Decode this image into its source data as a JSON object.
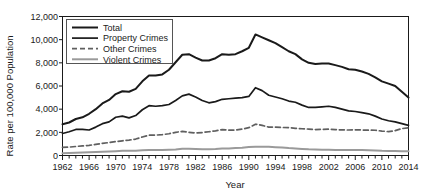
{
  "chart_data": {
    "type": "line",
    "title": "",
    "xlabel": "Year",
    "ylabel": "Rate per 100,000 Population",
    "xlim": [
      1962,
      2014
    ],
    "ylim": [
      0,
      12000
    ],
    "ytick_labels": [
      "0",
      "2,000",
      "4,000",
      "6,000",
      "8,000",
      "10,000",
      "12,000"
    ],
    "ytick_values": [
      0,
      2000,
      4000,
      6000,
      8000,
      10000,
      12000
    ],
    "xtick_labels": [
      "1962",
      "1966",
      "1970",
      "1974",
      "1978",
      "1982",
      "1986",
      "1990",
      "1994",
      "1998",
      "2002",
      "2006",
      "2010",
      "2014"
    ],
    "xtick_values": [
      1962,
      1966,
      1970,
      1974,
      1978,
      1982,
      1986,
      1990,
      1994,
      1998,
      2002,
      2006,
      2010,
      2014
    ],
    "minor_xtick_interval": 1,
    "grid": false,
    "legend_position": "top-left",
    "x": [
      1962,
      1963,
      1964,
      1965,
      1966,
      1967,
      1968,
      1969,
      1970,
      1971,
      1972,
      1973,
      1974,
      1975,
      1976,
      1977,
      1978,
      1979,
      1980,
      1981,
      1982,
      1983,
      1984,
      1985,
      1986,
      1987,
      1988,
      1989,
      1990,
      1991,
      1992,
      1993,
      1994,
      1995,
      1996,
      1997,
      1998,
      1999,
      2000,
      2001,
      2002,
      2003,
      2004,
      2005,
      2006,
      2007,
      2008,
      2009,
      2010,
      2011,
      2012,
      2013,
      2014
    ],
    "series": [
      {
        "name": "Total",
        "color": "#1a1a1a",
        "width": 2.0,
        "dash": "none",
        "values": [
          2700,
          2850,
          3150,
          3300,
          3600,
          4000,
          4500,
          4800,
          5300,
          5550,
          5500,
          5750,
          6400,
          6900,
          6900,
          7000,
          7400,
          8050,
          8700,
          8750,
          8450,
          8200,
          8200,
          8400,
          8750,
          8700,
          8750,
          9000,
          9300,
          10450,
          10200,
          9950,
          9700,
          9350,
          9000,
          8750,
          8300,
          8000,
          7900,
          7950,
          7950,
          7800,
          7650,
          7450,
          7400,
          7250,
          7050,
          6750,
          6400,
          6200,
          6000,
          5500,
          5000
        ]
      },
      {
        "name": "Property Crimes",
        "color": "#1a1a1a",
        "width": 1.7,
        "dash": "none",
        "values": [
          1900,
          2050,
          2250,
          2250,
          2200,
          2450,
          2750,
          2900,
          3300,
          3400,
          3250,
          3450,
          3950,
          4300,
          4250,
          4300,
          4400,
          4750,
          5150,
          5300,
          5050,
          4750,
          4550,
          4650,
          4850,
          4900,
          4950,
          5000,
          5100,
          5850,
          5600,
          5200,
          5050,
          4900,
          4700,
          4600,
          4350,
          4150,
          4150,
          4200,
          4250,
          4150,
          4000,
          3850,
          3800,
          3700,
          3600,
          3400,
          3150,
          3000,
          2900,
          2750,
          2600
        ]
      },
      {
        "name": "Other Crimes",
        "color": "#5f5f5f",
        "width": 1.7,
        "dash": "5,3",
        "values": [
          700,
          720,
          780,
          830,
          880,
          960,
          1050,
          1120,
          1200,
          1270,
          1330,
          1420,
          1600,
          1750,
          1760,
          1800,
          1880,
          2000,
          2080,
          2000,
          1950,
          1980,
          2050,
          2130,
          2230,
          2190,
          2200,
          2280,
          2400,
          2700,
          2600,
          2450,
          2450,
          2420,
          2400,
          2350,
          2310,
          2280,
          2240,
          2260,
          2270,
          2230,
          2210,
          2200,
          2220,
          2200,
          2190,
          2180,
          2110,
          2060,
          2150,
          2320,
          2400
        ]
      },
      {
        "name": "Violent Crimes",
        "color": "#9a9a9a",
        "width": 2.0,
        "dash": "none",
        "values": [
          200,
          210,
          230,
          250,
          270,
          300,
          330,
          350,
          370,
          400,
          410,
          420,
          450,
          480,
          470,
          470,
          490,
          520,
          580,
          590,
          570,
          540,
          540,
          560,
          610,
          610,
          640,
          660,
          730,
          760,
          760,
          750,
          720,
          690,
          640,
          610,
          570,
          530,
          510,
          500,
          500,
          480,
          470,
          470,
          480,
          470,
          460,
          430,
          400,
          390,
          390,
          370,
          370
        ]
      }
    ]
  },
  "legend": {
    "entries": [
      {
        "label": "Total"
      },
      {
        "label": "Property Crimes"
      },
      {
        "label": "Other Crimes"
      },
      {
        "label": "Violent Crimes"
      }
    ]
  }
}
